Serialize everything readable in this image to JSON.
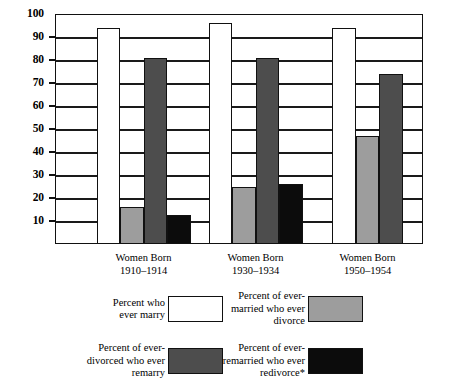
{
  "chart_data": {
    "type": "bar",
    "title": "",
    "subtitle": "",
    "xlabel": "",
    "ylabel": "",
    "ylim": [
      0,
      100
    ],
    "yticks": [
      10,
      20,
      30,
      40,
      50,
      60,
      70,
      80,
      90,
      100
    ],
    "ytick_labels": [
      "10",
      "20",
      "30",
      "40",
      "50",
      "60",
      "70",
      "80",
      "90",
      "100"
    ],
    "grid": true,
    "legend_position": "bottom",
    "categories": [
      "Women Born\n1910–1914",
      "Women Born\n1930–1934",
      "Women Born\n1950–1954"
    ],
    "category_lines": [
      [
        "Women Born",
        "1910–1914"
      ],
      [
        "Women Born",
        "1930–1934"
      ],
      [
        "Women Born",
        "1950–1954"
      ]
    ],
    "series": [
      {
        "name": "Percent who ever marry",
        "color": "#ffffff",
        "swatch": "white",
        "values": [
          94,
          96,
          94
        ]
      },
      {
        "name": "Percent of ever-married who ever divorce",
        "color": "#9d9d9d",
        "swatch": "lgray",
        "values": [
          16,
          25,
          47
        ]
      },
      {
        "name": "Percent of ever-divorced who ever remarry",
        "color": "#4d4d4d",
        "swatch": "dgray",
        "values": [
          81,
          81,
          74
        ]
      },
      {
        "name": "Percent of ever-remarried who ever redivorce*",
        "color": "#0c0c0c",
        "swatch": "black",
        "values": [
          12.5,
          26,
          null
        ]
      }
    ],
    "annotations": [
      "*"
    ]
  },
  "legend": {
    "items": [
      {
        "label": "Percent who\never marry",
        "swatch": "white"
      },
      {
        "label": "Percent of ever-\nmarried who ever\ndivorce",
        "swatch": "lgray"
      },
      {
        "label": "Percent of ever-\ndivorced who ever\nremarry",
        "swatch": "dgray"
      },
      {
        "label": "Percent of ever-\nremarried who ever\nredivorce*",
        "swatch": "black"
      }
    ]
  },
  "axis": {
    "y_labels": [
      "100",
      "90",
      "80",
      "70",
      "60",
      "50",
      "40",
      "30",
      "20",
      "10"
    ]
  },
  "x_axis": {
    "groups": [
      {
        "line1": "Women Born",
        "line2": "1910–1914"
      },
      {
        "line1": "Women Born",
        "line2": "1930–1934"
      },
      {
        "line1": "Women Born",
        "line2": "1950–1954"
      }
    ]
  },
  "colors": {
    "ever_marry": "#ffffff",
    "ever_divorce": "#9d9d9d",
    "ever_remarry": "#4d4d4d",
    "ever_redivorce": "#0c0c0c",
    "axis": "#111111"
  }
}
